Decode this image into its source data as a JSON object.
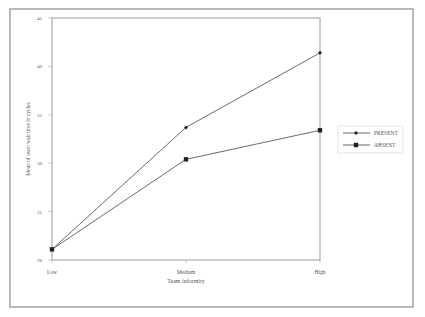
{
  "chart_data": {
    "type": "line",
    "title": "",
    "xlabel": "Team informity",
    "ylabel": "Mean of team wait time in cycles",
    "categories": [
      "Low",
      "Medium",
      "High"
    ],
    "series": [
      {
        "name": "PRESENT",
        "marker": "diamond",
        "values": [
          21.1,
          33.7,
          41.4
        ]
      },
      {
        "name": "ABSENT",
        "marker": "square",
        "values": [
          21.1,
          30.4,
          33.4
        ]
      }
    ],
    "ylim": [
      20,
      45
    ],
    "yticks": [
      20,
      25,
      30,
      35,
      40,
      45
    ],
    "grid": false,
    "legend_position": "right"
  },
  "colors": {
    "line": "#6b6b6b",
    "marker": "#222222",
    "frame": "#888888",
    "text": "#555555"
  }
}
